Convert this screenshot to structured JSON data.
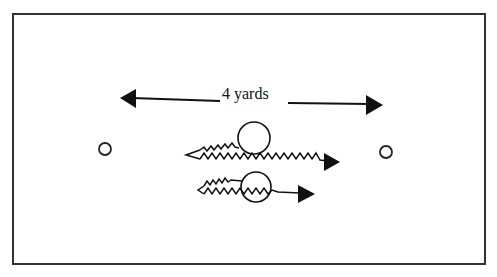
{
  "diagram": {
    "distance_label": "4 yards",
    "colors": {
      "stroke": "#111111",
      "frame": "#333333",
      "background": "#ffffff"
    },
    "elements": {
      "distance_arrow": {
        "from_x": 120,
        "to_x": 383,
        "label": "4 yards"
      },
      "cones": [
        {
          "name": "left-cone",
          "cx": 105,
          "cy": 149
        },
        {
          "name": "right-cone",
          "cx": 386,
          "cy": 152
        }
      ],
      "players": [
        {
          "name": "upper-player",
          "cx": 254,
          "cy": 138,
          "r": 16,
          "movement": "zigzag left-to-right with arrow"
        },
        {
          "name": "lower-player",
          "cx": 256,
          "cy": 187,
          "r": 15,
          "movement": "zigzag left-to-right with arrow"
        }
      ]
    }
  }
}
